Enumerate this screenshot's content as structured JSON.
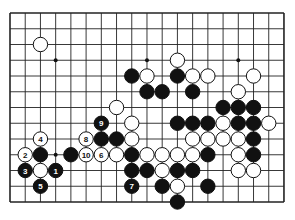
{
  "board": {
    "cols": 19,
    "rows": 13,
    "origin_x": 10,
    "origin_y": 13,
    "step_x": 15.22,
    "step_y": 15.75,
    "line_color": "#222222",
    "background": "#ffffff",
    "stone_radius": 7.2
  },
  "hoshi": [
    [
      3,
      3
    ],
    [
      9,
      3
    ],
    [
      15,
      3
    ],
    [
      3,
      9
    ]
  ],
  "stones": [
    {
      "c": 2,
      "r": 2,
      "color": "white"
    },
    {
      "c": 11,
      "r": 3,
      "color": "white"
    },
    {
      "c": 8,
      "r": 4,
      "color": "black"
    },
    {
      "c": 9,
      "r": 4,
      "color": "white"
    },
    {
      "c": 11,
      "r": 4,
      "color": "black"
    },
    {
      "c": 12,
      "r": 4,
      "color": "white"
    },
    {
      "c": 13,
      "r": 4,
      "color": "white"
    },
    {
      "c": 16,
      "r": 4,
      "color": "white"
    },
    {
      "c": 9,
      "r": 5,
      "color": "black"
    },
    {
      "c": 10,
      "r": 5,
      "color": "black"
    },
    {
      "c": 12,
      "r": 5,
      "color": "black"
    },
    {
      "c": 15,
      "r": 5,
      "color": "white"
    },
    {
      "c": 7,
      "r": 6,
      "color": "white"
    },
    {
      "c": 14,
      "r": 6,
      "color": "black"
    },
    {
      "c": 15,
      "r": 6,
      "color": "black"
    },
    {
      "c": 16,
      "r": 6,
      "color": "black"
    },
    {
      "c": 6,
      "r": 7,
      "color": "black",
      "label": "9"
    },
    {
      "c": 8,
      "r": 7,
      "color": "white"
    },
    {
      "c": 11,
      "r": 7,
      "color": "black"
    },
    {
      "c": 12,
      "r": 7,
      "color": "black"
    },
    {
      "c": 13,
      "r": 7,
      "color": "black"
    },
    {
      "c": 14,
      "r": 7,
      "color": "white"
    },
    {
      "c": 15,
      "r": 7,
      "color": "black"
    },
    {
      "c": 16,
      "r": 7,
      "color": "black"
    },
    {
      "c": 17,
      "r": 7,
      "color": "white"
    },
    {
      "c": 2,
      "r": 8,
      "color": "white",
      "label": "4"
    },
    {
      "c": 5,
      "r": 8,
      "color": "white",
      "label": "8"
    },
    {
      "c": 6,
      "r": 8,
      "color": "black"
    },
    {
      "c": 7,
      "r": 8,
      "color": "black"
    },
    {
      "c": 8,
      "r": 8,
      "color": "white"
    },
    {
      "c": 12,
      "r": 8,
      "color": "white"
    },
    {
      "c": 13,
      "r": 8,
      "color": "white"
    },
    {
      "c": 14,
      "r": 8,
      "color": "white"
    },
    {
      "c": 15,
      "r": 8,
      "color": "white"
    },
    {
      "c": 16,
      "r": 8,
      "color": "black"
    },
    {
      "c": 1,
      "r": 9,
      "color": "white",
      "label": "2"
    },
    {
      "c": 2,
      "r": 9,
      "color": "black"
    },
    {
      "c": 4,
      "r": 9,
      "color": "black"
    },
    {
      "c": 5,
      "r": 9,
      "color": "white",
      "label": "10"
    },
    {
      "c": 6,
      "r": 9,
      "color": "white",
      "label": "6"
    },
    {
      "c": 7,
      "r": 9,
      "color": "white"
    },
    {
      "c": 8,
      "r": 9,
      "color": "black"
    },
    {
      "c": 9,
      "r": 9,
      "color": "white"
    },
    {
      "c": 10,
      "r": 9,
      "color": "white"
    },
    {
      "c": 11,
      "r": 9,
      "color": "white"
    },
    {
      "c": 12,
      "r": 9,
      "color": "white"
    },
    {
      "c": 13,
      "r": 9,
      "color": "black"
    },
    {
      "c": 15,
      "r": 9,
      "color": "white"
    },
    {
      "c": 16,
      "r": 9,
      "color": "black"
    },
    {
      "c": 1,
      "r": 10,
      "color": "black",
      "label": "3"
    },
    {
      "c": 2,
      "r": 10,
      "color": "white"
    },
    {
      "c": 3,
      "r": 10,
      "color": "black",
      "label": "1"
    },
    {
      "c": 8,
      "r": 10,
      "color": "black"
    },
    {
      "c": 9,
      "r": 10,
      "color": "black"
    },
    {
      "c": 10,
      "r": 10,
      "color": "white"
    },
    {
      "c": 11,
      "r": 10,
      "color": "black"
    },
    {
      "c": 12,
      "r": 10,
      "color": "black"
    },
    {
      "c": 15,
      "r": 10,
      "color": "white"
    },
    {
      "c": 16,
      "r": 10,
      "color": "white"
    },
    {
      "c": 2,
      "r": 11,
      "color": "black",
      "label": "5"
    },
    {
      "c": 8,
      "r": 11,
      "color": "black",
      "label": "7"
    },
    {
      "c": 10,
      "r": 11,
      "color": "black"
    },
    {
      "c": 11,
      "r": 11,
      "color": "white"
    },
    {
      "c": 13,
      "r": 11,
      "color": "black"
    },
    {
      "c": 11,
      "r": 12,
      "color": "black"
    }
  ]
}
